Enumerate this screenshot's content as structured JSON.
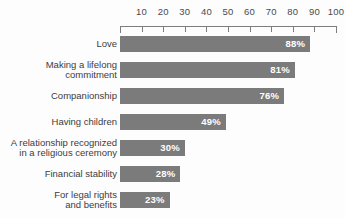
{
  "chart_data": {
    "type": "bar",
    "orientation": "horizontal",
    "title": "",
    "subtitle": "",
    "xlabel": "",
    "ylabel": "",
    "xlim": [
      0,
      100
    ],
    "grid": false,
    "legend": null,
    "axis_position": "top",
    "tick_labels": [
      "10",
      "20",
      "30",
      "40",
      "50",
      "60",
      "70",
      "80",
      "90",
      "100"
    ],
    "tick_values": [
      10,
      20,
      30,
      40,
      50,
      60,
      70,
      80,
      90,
      100
    ],
    "categories": [
      "Love",
      "Making a lifelong\ncommitment",
      "Companionship",
      "Having children",
      "A relationship recognized\nin a religious ceremony",
      "Financial stability",
      "For legal rights\nand benefits"
    ],
    "values": [
      88,
      81,
      76,
      49,
      30,
      28,
      23
    ],
    "value_labels": [
      "88%",
      "81%",
      "76%",
      "49%",
      "30%",
      "28%",
      "23%"
    ],
    "colors": {
      "bar": "#7b7b7b",
      "value_text": "#ffffff",
      "category_text": "#3c3c3c",
      "axis": "#7d7d7d",
      "tick_text": "#4a4a4a",
      "background": "#fdfdfd"
    }
  }
}
